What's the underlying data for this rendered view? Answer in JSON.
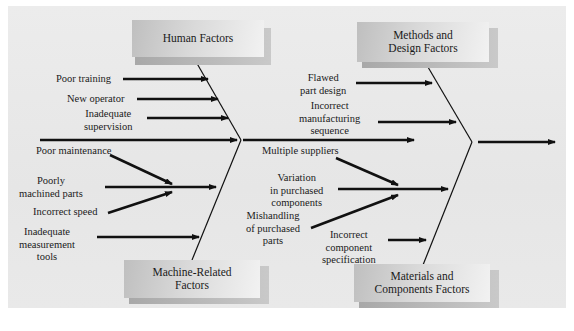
{
  "diagram": {
    "type": "cause-and-effect (fishbone)",
    "categories": {
      "human": {
        "title": "Human Factors",
        "causes": [
          "Poor training",
          "New operator",
          "Inadequate supervision"
        ]
      },
      "methods": {
        "title_line1": "Methods and",
        "title_line2": "Design Factors",
        "causes": [
          "Flawed part design",
          "Incorrect manufacturing sequence"
        ]
      },
      "machine": {
        "title_line1": "Machine-Related",
        "title_line2": "Factors",
        "causes": [
          "Poor maintenance",
          "Poorly machined parts",
          "Incorrect speed",
          "Inadequate measurement tools"
        ]
      },
      "materials": {
        "title_line1": "Materials and",
        "title_line2": "Components Factors",
        "causes": [
          "Multiple suppliers",
          "Variation in purchased components",
          "Mishandling of purchased parts",
          "Incorrect component specification"
        ]
      }
    },
    "labels": {
      "poor_training": "Poor training",
      "new_operator": "New operator",
      "inadequate_supervision_1": "Inadequate",
      "inadequate_supervision_2": "supervision",
      "poor_maintenance": "Poor maintenance",
      "poorly_machined_1": "Poorly",
      "poorly_machined_2": "machined parts",
      "incorrect_speed": "Incorrect speed",
      "inadequate_measurement_1": "Inadequate",
      "inadequate_measurement_2": "measurement",
      "inadequate_measurement_3": "tools",
      "flawed_design_1": "Flawed",
      "flawed_design_2": "part design",
      "incorrect_mfg_1": "Incorrect",
      "incorrect_mfg_2": "manufacturing",
      "incorrect_mfg_3": "sequence",
      "multiple_suppliers": "Multiple suppliers",
      "variation_1": "Variation",
      "variation_2": "in purchased",
      "variation_3": "components",
      "mishandling_1": "Mishandling",
      "mishandling_2": "of purchased",
      "mishandling_3": "parts",
      "incorrect_spec_1": "Incorrect",
      "incorrect_spec_2": "component",
      "incorrect_spec_3": "specification"
    },
    "colors": {
      "panel": "#e8e8e8",
      "box_dark": "#bfbfbf",
      "box_light": "#f2f2f2",
      "line": "#111111"
    }
  }
}
